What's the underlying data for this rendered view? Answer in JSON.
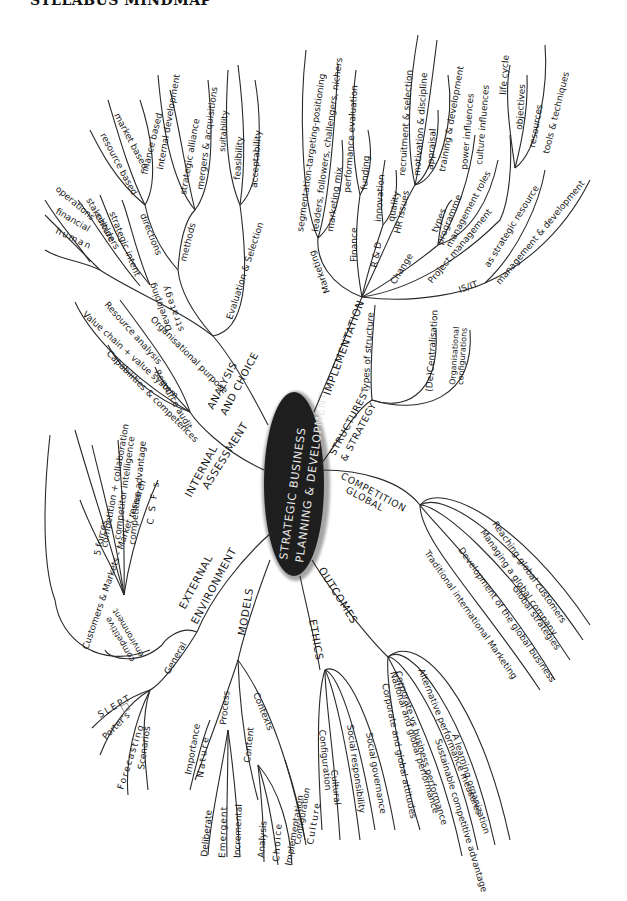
{
  "header": {
    "title": "SYLLABUS MINDMAP"
  },
  "center": {
    "line1": "STRATEGIC BUSINESS",
    "line2": "PLANNING & DEVELOPMENT",
    "fill": "#1e1e1e"
  },
  "branches": {
    "implementation": {
      "label": "IMPLEMENTATION",
      "marketing": {
        "label": "Marketing",
        "items": [
          "segmentation-targeting-positioning",
          "leaders, followers, challengers, nichers",
          "marketing mix"
        ]
      },
      "finance": {
        "label": "Finance",
        "items": [
          "performance evaluation",
          "funding"
        ]
      },
      "rd": {
        "label": "R & D",
        "items": [
          "innovation",
          "quality"
        ]
      },
      "hr": {
        "label": "HR issues",
        "items": [
          "recruitment & selection",
          "motivation & discipline",
          "appraisal",
          "training & development"
        ]
      },
      "change": {
        "label": "Change",
        "items": [
          "types",
          "programme",
          "power influences",
          "culture influences",
          "management roles"
        ]
      },
      "project": {
        "label": "Project management",
        "items": [
          "life cycle",
          "objectives",
          "resources",
          "tools & techniques"
        ]
      },
      "isit": {
        "label": "IS/IT",
        "items": [
          "as strategic resource",
          "management & development"
        ]
      }
    },
    "structures": {
      "label_line1": "STRUCTURES",
      "label_line2": "& STRATEGY",
      "sub": {
        "label": "Types of structure",
        "items": [
          "(De)Centralisation",
          "Organisational",
          "configurations"
        ]
      }
    },
    "global": {
      "label_line1": "GLOBAL",
      "label_line2": "COMPETITION",
      "items": [
        "Reaching global customers",
        "Managing a global company",
        "Global strategies",
        "Development of the global business",
        "Traditional international Marketing"
      ]
    },
    "outcomes": {
      "label": "OUTCOMES",
      "items": [
        "Alternative performance measures",
        "A learning organization",
        "Sustainable competitive advantage",
        "Corporate vs business performance",
        "National and global performance"
      ]
    },
    "ethics": {
      "label": "ETHICS",
      "items": [
        "Corporate and global attitudes",
        "Social governance",
        "Social responsibility",
        "Cultural",
        "Configuration"
      ]
    },
    "models": {
      "label": "MODELS",
      "process": {
        "label": "Process",
        "items": [
          "Importance",
          "Nature",
          "Deliberate",
          "Emergent",
          "Incremental"
        ]
      },
      "content": {
        "label": "Content",
        "items": [
          "Analysis",
          "Choice",
          "Implementation"
        ]
      },
      "contexts": {
        "label": "Contexts",
        "items": [
          "Configuration",
          "Culture"
        ]
      }
    },
    "external": {
      "label_line1": "EXTERNAL",
      "label_line2": "ENVIRONMENT",
      "competitive": {
        "label_line1": "competitive",
        "label_line2": "environment",
        "items": [
          "Customers & Markets - Market research",
          "5 forces",
          "competition + collaboration",
          "competitor intelligence",
          "competitive advantage",
          "C S F s"
        ]
      },
      "general": {
        "label": "General",
        "items": [
          "SLEPT",
          "Porter's",
          "Forecasting",
          "Scenarios"
        ]
      }
    },
    "internal": {
      "label_line1": "INTERNAL",
      "label_line2": "ASSESSMENT",
      "items": [
        "Resource audit",
        "Capabilities & competences",
        "Value chain + value system",
        "Resource analysis"
      ]
    },
    "analysis": {
      "label_line1": "ANALYSIS",
      "label_line2": "AND CHOICE",
      "org": {
        "label": "Organisational purpose",
        "items": [
          "human",
          "financial",
          "operations",
          "stakeholders",
          "culture",
          "strategic intent"
        ]
      },
      "developing": {
        "label_line1": "Developing",
        "label_line2": "strategy",
        "directions": {
          "label": "directions",
          "items": [
            "resource based",
            "market based",
            "finance based"
          ]
        },
        "methods": {
          "label": "methods",
          "items": [
            "internal development",
            "strategic alliance",
            "mergers & acquisitions"
          ]
        }
      },
      "evaluation": {
        "label": "Evaluation & Selection",
        "items": [
          "suitability",
          "feasibility",
          "acceptability"
        ]
      }
    }
  }
}
